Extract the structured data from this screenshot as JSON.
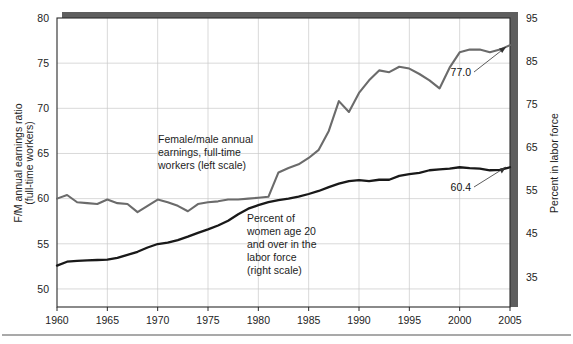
{
  "chart_data": {
    "type": "line",
    "title": "",
    "xlabel": "",
    "ylabel": "F/M annual earnings ratio (full-time workers)",
    "y2label": "Percent in labor force",
    "grid": true,
    "legend": "annotations-inline",
    "xlim": [
      1960,
      2005
    ],
    "ylim": [
      48,
      80
    ],
    "y2lim": [
      28,
      95
    ],
    "x_ticks": [
      1960,
      1965,
      1970,
      1975,
      1980,
      1985,
      1990,
      1995,
      2000,
      2005
    ],
    "x_tick_labels": [
      "1960",
      "1965",
      "1970",
      "1975",
      "1980",
      "1985",
      "1990",
      "1995",
      "2000",
      "2005"
    ],
    "y_ticks": [
      50,
      55,
      60,
      65,
      70,
      75,
      80
    ],
    "y_tick_labels": [
      "50",
      "55",
      "60",
      "65",
      "70",
      "75",
      "80"
    ],
    "y2_ticks": [
      35,
      45,
      55,
      65,
      75,
      85,
      95
    ],
    "y2_tick_labels": [
      "35",
      "45",
      "55",
      "65",
      "75",
      "85",
      "95"
    ],
    "series": [
      {
        "name": "Female/male annual earnings, full-time workers (left scale)",
        "axis": "left",
        "color": "#6b6b6b",
        "x": [
          1960,
          1961,
          1962,
          1963,
          1964,
          1965,
          1966,
          1967,
          1968,
          1969,
          1970,
          1971,
          1972,
          1973,
          1974,
          1975,
          1976,
          1977,
          1978,
          1979,
          1980,
          1981,
          1982,
          1983,
          1984,
          1985,
          1986,
          1987,
          1988,
          1989,
          1990,
          1991,
          1992,
          1993,
          1994,
          1995,
          1996,
          1997,
          1998,
          1999,
          2000,
          2001,
          2002,
          2003,
          2004,
          2005
        ],
        "values": [
          60.0,
          60.4,
          59.6,
          59.5,
          59.4,
          59.9,
          59.5,
          59.4,
          58.5,
          59.2,
          59.9,
          59.6,
          59.2,
          58.6,
          59.4,
          59.6,
          59.7,
          59.9,
          59.9,
          60.0,
          60.1,
          60.2,
          62.9,
          63.4,
          63.8,
          64.5,
          65.4,
          67.5,
          70.8,
          69.6,
          71.7,
          73.1,
          74.2,
          74.0,
          74.6,
          74.4,
          73.8,
          73.1,
          72.2,
          74.5,
          76.2,
          76.5,
          76.5,
          76.2,
          76.5,
          77.0
        ]
      },
      {
        "name": "Percent of women age 20 and over in the labor force (right scale)",
        "axis": "right",
        "color": "#191919",
        "x": [
          1960,
          1961,
          1962,
          1963,
          1964,
          1965,
          1966,
          1967,
          1968,
          1969,
          1970,
          1971,
          1972,
          1973,
          1974,
          1975,
          1976,
          1977,
          1978,
          1979,
          1980,
          1981,
          1982,
          1983,
          1984,
          1985,
          1986,
          1987,
          1988,
          1989,
          1990,
          1991,
          1992,
          1993,
          1994,
          1995,
          1996,
          1997,
          1998,
          1999,
          2000,
          2001,
          2002,
          2003,
          2004,
          2005
        ],
        "values": [
          37.6,
          38.5,
          38.7,
          38.8,
          38.9,
          39.0,
          39.4,
          40.1,
          40.8,
          41.8,
          42.6,
          42.9,
          43.5,
          44.3,
          45.2,
          46.0,
          46.9,
          48.0,
          49.5,
          50.8,
          51.6,
          52.3,
          52.8,
          53.1,
          53.6,
          54.2,
          54.9,
          55.8,
          56.6,
          57.2,
          57.4,
          57.2,
          57.5,
          57.5,
          58.4,
          58.8,
          59.1,
          59.7,
          59.9,
          60.1,
          60.4,
          60.2,
          60.1,
          59.7,
          59.8,
          60.4
        ]
      }
    ],
    "annotations": [
      {
        "name": "gray-series-annotation",
        "lines": [
          "Female/male annual",
          "earnings, full-time",
          "workers (left scale)"
        ]
      },
      {
        "name": "black-series-annotation",
        "lines": [
          "Percent of",
          "women age 20",
          "and over in the",
          "labor force",
          "(right scale)"
        ]
      }
    ],
    "end_labels": [
      {
        "name": "gray-end-value",
        "text": "77.0",
        "series": "Female/male annual earnings ratio",
        "year": 2005,
        "value": 77.0
      },
      {
        "name": "black-end-value",
        "text": "60.4",
        "series": "Percent of women age 20 and over in labor force",
        "year": 2005,
        "value": 60.4
      }
    ],
    "colors": {
      "gray_series": "#6b6b6b",
      "black_series": "#191919",
      "grid": "#c9c9c9",
      "frame": "#2a2a2a",
      "shadow": "#5e5e5e",
      "background": "#ffffff"
    }
  }
}
